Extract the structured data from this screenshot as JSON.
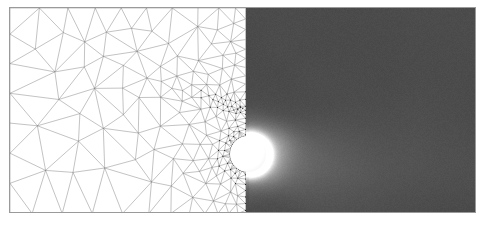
{
  "figure": {
    "title": "",
    "background_color": "#ffffff",
    "frame_color": "#9a9a9a",
    "width": 490,
    "height": 230
  },
  "panels": {
    "left": {
      "name": "adaptive triangular mesh",
      "label": "",
      "edge_color": "#6e6e6e",
      "node_color": "#1a1a1a",
      "background": "#ffffff",
      "refinement": "coarse upstream, highly refined in the wake band and around the cylinder"
    },
    "right": {
      "name": "flow field magnitude",
      "label": "",
      "background": "#4a4a4a",
      "high_value_color": "#ffffff",
      "low_value_color": "#3f3f3f",
      "feature": "bright shear layers and wake plume shedding downstream of the cylinder"
    }
  },
  "geometry": {
    "cylinder": {
      "label": "",
      "center_x": 247,
      "center_y": 153,
      "radius": 18,
      "fill": "#ffffff"
    },
    "split_x": 245
  },
  "chart_data": {
    "type": "heatmap",
    "title": "",
    "xlabel": "",
    "ylabel": "",
    "grid": false,
    "legend": "none",
    "xlim": [
      0,
      467
    ],
    "ylim": [
      0,
      206
    ],
    "series": [
      {
        "name": "mesh",
        "values": []
      },
      {
        "name": "field",
        "values": []
      }
    ]
  }
}
